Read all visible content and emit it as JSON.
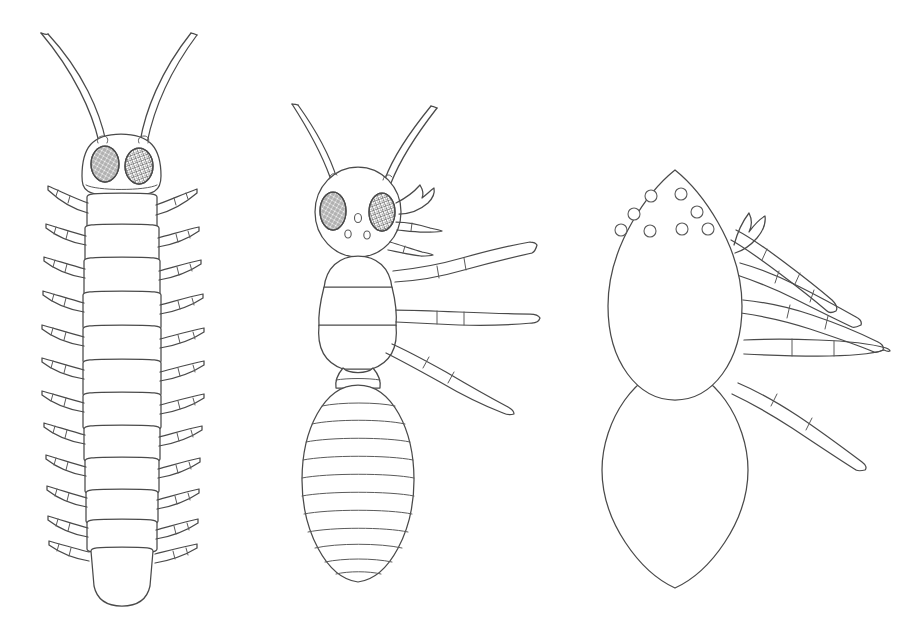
{
  "page": {
    "background_color": "#ffffff",
    "ink_color": "#4a4a4a",
    "width": 898,
    "height": 644,
    "style": "black-and-white outline / coloring-book line art",
    "figure_count": 3
  },
  "figures": [
    {
      "id": "figure-left",
      "name": "centipede-like-arthropod",
      "label": "",
      "position": "left",
      "orientation": "dorsal view, head up",
      "bounds": {
        "x": 20,
        "y": 28,
        "width": 215,
        "height": 580
      },
      "parts": {
        "antennae": 2,
        "antenna_shape": "long, slender, curved, tapering to a point, sweeping outward and upward",
        "head_shape": "rounded rectangle / dome",
        "eyes": 2,
        "eye_type": "compound",
        "eye_shape": "large oval",
        "eye_texture": "cross-hatched mesh shading",
        "body_segments": 13,
        "leg_pairs": 13,
        "legs_total": 26,
        "leg_segments_each": 3,
        "leg_shape": "short, jointed, tapering to a fine point, angled outward",
        "terminal_segment": "rounded tail plate, legless"
      }
    },
    {
      "id": "figure-middle",
      "name": "ant-like-insect",
      "label": "",
      "position": "center",
      "orientation": "dorsal view, head up",
      "bounds": {
        "x": 285,
        "y": 100,
        "width": 285,
        "height": 485
      },
      "parts": {
        "antennae": 2,
        "antenna_shape": "long, slender, curved, tapering, rising from top of head",
        "head_shape": "large round globe",
        "eyes": 2,
        "eye_type": "compound",
        "eye_shape": "large oval, set wide on the head",
        "eye_texture": "cross-hatched mesh shading",
        "ocelli": 3,
        "ocelli_arrangement": "triangle on the face (one upper center, two lower)",
        "mouthparts": "toothed mandible plus two segmented palps on the right side",
        "thorax_segments": 3,
        "petiole": "small narrow waist node between thorax and abdomen",
        "abdomen_shape": "large oval / teardrop",
        "abdomen_bands": 12,
        "legs_drawn": 3,
        "legs_side": "right side only",
        "leg_segments_each": 3
      }
    },
    {
      "id": "figure-right",
      "name": "spider-like-arachnid",
      "label": "",
      "position": "right",
      "orientation": "dorsal view, head up",
      "bounds": {
        "x": 590,
        "y": 168,
        "width": 300,
        "height": 420
      },
      "parts": {
        "cephalothorax_shape": "teardrop / egg, pointed at top",
        "eyes": 8,
        "eye_type": "simple eyes (ocelli)",
        "eye_arrangement": "three rows on the front of the cephalothorax: 2 top, 2 middle, 4 bottom",
        "eye_shape": "small open circles",
        "chelicera": "small hooked fang above the legs",
        "legs_drawn": 5,
        "legs_side": "right side only",
        "leg_segments_each": "2 to 3",
        "leg_shape": "long, jointed, tapering to a fine point, fanning outward",
        "abdomen_shape": "large pointed oval / leaf, plain and unmarked",
        "antennae": 0
      }
    }
  ]
}
